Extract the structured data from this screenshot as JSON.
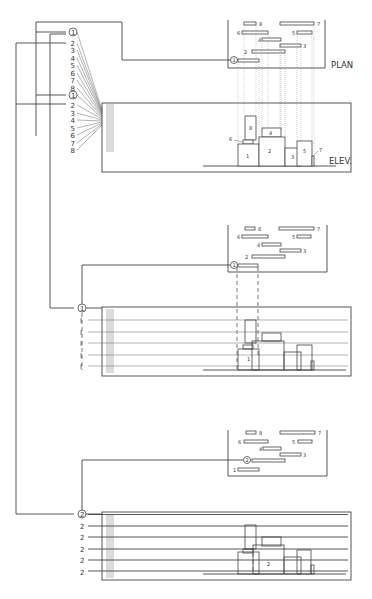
{
  "diagram": {
    "type": "architectural layering diagram (plan + elevation, three stages)",
    "labels": {
      "plan": "PLAN",
      "elevation": "ELEV."
    },
    "index_list_top": [
      "1",
      "2",
      "3",
      "4",
      "5",
      "6",
      "7",
      "8"
    ],
    "index_list_bottom": [
      "1",
      "2",
      "3",
      "4",
      "5",
      "6",
      "7",
      "8"
    ],
    "stage2_markers": {
      "circle": "1",
      "rows": [
        "I",
        "I",
        "I",
        "I",
        "I"
      ]
    },
    "stage3_markers": {
      "circle": "2",
      "rows": [
        "2",
        "2",
        "2",
        "2",
        "2"
      ]
    },
    "plan_bars": [
      {
        "id": "1",
        "label": "1"
      },
      {
        "id": "2",
        "label": "2"
      },
      {
        "id": "3",
        "label": "3"
      },
      {
        "id": "4",
        "label": "4"
      },
      {
        "id": "5",
        "label": "5"
      },
      {
        "id": "6",
        "label": "6"
      },
      {
        "id": "7",
        "label": "7"
      },
      {
        "id": "8",
        "label": "8"
      }
    ],
    "elevation_blocks": [
      {
        "id": "1",
        "label": "1"
      },
      {
        "id": "2",
        "label": "2"
      },
      {
        "id": "3",
        "label": "3"
      },
      {
        "id": "4",
        "label": "4"
      },
      {
        "id": "5",
        "label": "5"
      },
      {
        "id": "6",
        "label": "6"
      },
      {
        "id": "7",
        "label": "7"
      },
      {
        "id": "8",
        "label": "8"
      }
    ],
    "stage_plan_markers": {
      "stage1": "1",
      "stage2": "1",
      "stage3": "2",
      "stage3_bar1_label": "1"
    },
    "stage2_elev_label": "1",
    "stage3_elev_label": "2"
  }
}
